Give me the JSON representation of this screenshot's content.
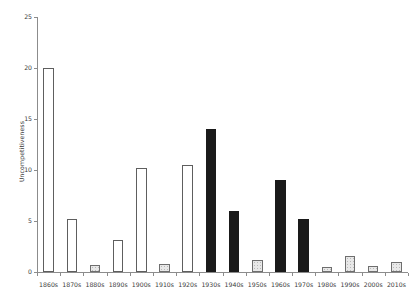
{
  "chart_data": {
    "type": "bar",
    "title": "",
    "subtitle": "",
    "xlabel": "",
    "ylabel": "Uncompetitiveness",
    "ylim": [
      0,
      25
    ],
    "yticks": [
      0,
      5,
      10,
      15,
      20,
      25
    ],
    "ytick_labels": [
      "0",
      "5",
      "10",
      "15",
      "20",
      "25"
    ],
    "grid": false,
    "legend": null,
    "categories": [
      "1860s",
      "1870s",
      "1880s",
      "1890s",
      "1900s",
      "1910s",
      "1920s",
      "1930s",
      "1940s",
      "1950s",
      "1960s",
      "1970s",
      "1980s",
      "1990s",
      "2000s",
      "2010s"
    ],
    "values": [
      20,
      5.2,
      0.7,
      3.1,
      10.2,
      0.8,
      10.5,
      14,
      6,
      1.2,
      9,
      5.2,
      0.5,
      1.6,
      0.6,
      1.0
    ],
    "bar_styles": [
      "open",
      "open",
      "speckle",
      "open",
      "open",
      "speckle",
      "open",
      "filled",
      "filled",
      "speckle",
      "filled",
      "filled",
      "speckle",
      "speckle",
      "speckle",
      "speckle"
    ],
    "colors": {
      "open_fill": "#ffffff",
      "open_stroke": "#5e5e5e",
      "filled": "#1a1a1a",
      "speckle_fill": "#e8e8e8",
      "speckle_stroke": "#6e6e6e",
      "axis": "#8c8c8c",
      "text": "#3b3b3b",
      "background": "#ffffff"
    }
  }
}
